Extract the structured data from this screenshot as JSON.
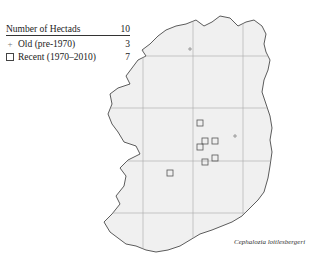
{
  "legend": {
    "header_label": "Number of Hectads",
    "header_value": "10",
    "rows": [
      {
        "symbol": "plus",
        "label": "Old  (pre-1970)",
        "value": "3"
      },
      {
        "symbol": "square",
        "label": "Recent  (1970–2010)",
        "value": "7"
      }
    ]
  },
  "map": {
    "region": "Ireland",
    "grid": {
      "vertical_x": [
        143,
        193,
        243
      ],
      "horizontal_y": [
        56,
        108,
        161,
        213
      ]
    },
    "recent_records": [
      [
        200,
        123
      ],
      [
        205,
        141
      ],
      [
        215,
        141
      ],
      [
        200,
        147
      ],
      [
        215,
        158
      ],
      [
        205,
        162
      ],
      [
        170,
        173
      ]
    ],
    "old_records": [
      [
        235,
        136
      ],
      [
        190,
        49
      ],
      [
        192,
        57
      ]
    ]
  },
  "caption": "Cephalozia loitlesbergeri"
}
